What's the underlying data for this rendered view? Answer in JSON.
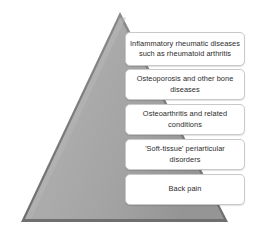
{
  "diagram": {
    "type": "pyramid",
    "title": "",
    "shape": {
      "name": "triangle",
      "fill_color": "#a3a3a3",
      "edge_color": "#6e6e6e",
      "highlight_color": "#bdbdbd",
      "apex": {
        "x": 120,
        "y": 12
      },
      "bottom_left": {
        "x": 21,
        "y": 222
      },
      "bottom_right": {
        "x": 228,
        "y": 222
      }
    },
    "tiers": [
      {
        "label": "Inflammatory rheumatic diseases such as rheumatoid arthritis"
      },
      {
        "label": "Osteoporosis and other bone diseases"
      },
      {
        "label": "Osteoarthritis and related conditions"
      },
      {
        "label": "'Soft-tissue' periarticular disorders"
      },
      {
        "label": "Back pain"
      }
    ],
    "box_style": {
      "background": "#ffffff",
      "border_color": "#c9c9c9",
      "text_color": "#2b2b2b"
    }
  }
}
